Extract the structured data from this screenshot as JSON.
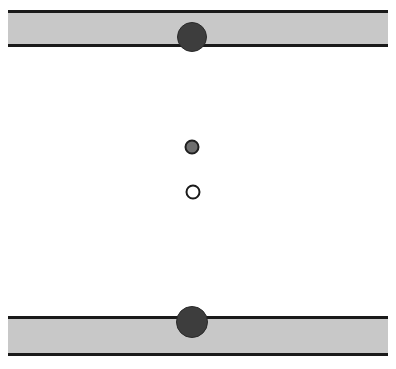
{
  "canvas": {
    "width": 396,
    "height": 369,
    "background": "#ffffff",
    "title": "two-slab-particle-diagram"
  },
  "palette": {
    "slab_fill": "#c8c8c8",
    "slab_edge": "#1a1a1a",
    "dark_particle": "#3d3d3d",
    "dark_particle_edge": "#2a2a2a",
    "mid_particle": "#6e6e6e",
    "mid_particle_edge": "#1f1f1f",
    "open_particle_fill": "#ffffff",
    "open_particle_edge": "#1a1a1a",
    "background": "#ffffff"
  },
  "slabs": [
    {
      "name": "top-slab",
      "x": 8,
      "y": 10,
      "width": 380,
      "height": 37,
      "fill": "#c8c8c8",
      "edge_color": "#1a1a1a",
      "edge_width": 3,
      "edges": [
        "top",
        "bottom"
      ]
    },
    {
      "name": "bottom-slab",
      "x": 8,
      "y": 316,
      "width": 380,
      "height": 40,
      "fill": "#c8c8c8",
      "edge_color": "#1a1a1a",
      "edge_width": 3,
      "edges": [
        "top",
        "bottom"
      ]
    }
  ],
  "particles": [
    {
      "name": "top-large-particle",
      "cx": 192,
      "cy": 37,
      "r": 15,
      "fill": "#3d3d3d",
      "stroke": "#2a2a2a",
      "stroke_width": 1,
      "style": "filled-dark",
      "anchor": "top-slab-lower-edge"
    },
    {
      "name": "center-mid-particle",
      "cx": 192,
      "cy": 147,
      "r": 7.5,
      "fill": "#6e6e6e",
      "stroke": "#1f1f1f",
      "stroke_width": 2,
      "style": "filled-gray",
      "anchor": "free-space"
    },
    {
      "name": "center-open-particle",
      "cx": 193,
      "cy": 192,
      "r": 7.5,
      "fill": "#ffffff",
      "stroke": "#1a1a1a",
      "stroke_width": 2,
      "style": "hollow",
      "anchor": "free-space"
    },
    {
      "name": "bottom-large-particle",
      "cx": 192,
      "cy": 322,
      "r": 16,
      "fill": "#3d3d3d",
      "stroke": "#2a2a2a",
      "stroke_width": 1,
      "style": "filled-dark",
      "anchor": "bottom-slab-upper-edge"
    }
  ]
}
